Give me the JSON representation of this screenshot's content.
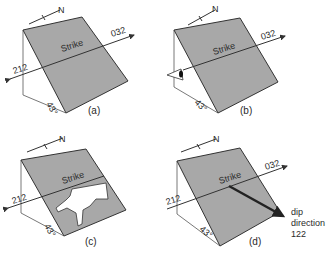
{
  "figure": {
    "panels": [
      {
        "id": "a",
        "label": "(a)",
        "strike_label": "Strike",
        "bearing_right": "032",
        "bearing_left": "212",
        "dip_angle": "43°",
        "north_label": "N"
      },
      {
        "id": "b",
        "label": "(b)",
        "strike_label": "Strike",
        "bearing_right": "032",
        "dip_angle": "43°",
        "north_label": "N"
      },
      {
        "id": "c",
        "label": "(c)",
        "strike_label": "Strike",
        "bearing_left": "212",
        "dip_angle": "43°",
        "north_label": "N"
      },
      {
        "id": "d",
        "label": "(d)",
        "strike_label": "Strike",
        "bearing_right": "032",
        "bearing_left": "212",
        "dip_angle": "43°",
        "north_label": "N",
        "dip_dir_line1": "dip",
        "dip_dir_line2": "direction",
        "dip_dir_value": "122"
      }
    ],
    "colors": {
      "plane": "#a8a8a8",
      "line": "#333333",
      "arrow": "#222222"
    }
  }
}
